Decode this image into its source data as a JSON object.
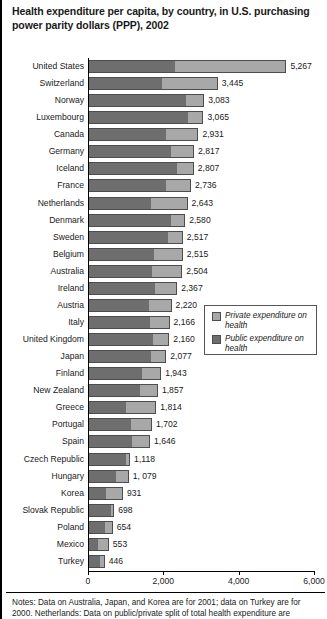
{
  "chart_data": {
    "type": "bar",
    "orientation": "horizontal",
    "stacked": true,
    "title": "Health expenditure per capita, by country, in U.S. purchasing power parity dollars (PPP), 2002",
    "xlabel": "",
    "ylabel": "",
    "xlim": [
      0,
      6000
    ],
    "xticks": [
      0,
      2000,
      4000,
      6000
    ],
    "xtick_labels": [
      "0",
      "2,000",
      "4,000",
      "6,000"
    ],
    "grid": false,
    "legend_position": "middle-right",
    "legend": [
      {
        "name": "Private expenditure on health",
        "color": "#a8a8a8"
      },
      {
        "name": "Public expenditure on health",
        "color": "#6e6e6e"
      }
    ],
    "categories": [
      "United States",
      "Switzerland",
      "Norway",
      "Luxembourg",
      "Canada",
      "Germany",
      "Iceland",
      "France",
      "Netherlands",
      "Denmark",
      "Sweden",
      "Belgium",
      "Australia",
      "Ireland",
      "Austria",
      "Italy",
      "United Kingdom",
      "Japan",
      "Finland",
      "New Zealand",
      "Greece",
      "Portugal",
      "Spain",
      "Czech Republic",
      "Hungary",
      "Korea",
      "Slovak Republic",
      "Poland",
      "Mexico",
      "Turkey"
    ],
    "values": [
      5267,
      3445,
      3083,
      3065,
      2931,
      2817,
      2807,
      2736,
      2643,
      2580,
      2517,
      2515,
      2504,
      2367,
      2220,
      2166,
      2160,
      2077,
      1943,
      1857,
      1814,
      1702,
      1646,
      1118,
      1079,
      931,
      698,
      654,
      553,
      446
    ],
    "value_labels": [
      "5,267",
      "3,445",
      "3,083",
      "3,065",
      "2,931",
      "2,817",
      "2,807",
      "2,736",
      "2,643",
      "2,580",
      "2,517",
      "2,515",
      "2,504",
      "2,367",
      "2,220",
      "2,166",
      "2,160",
      "2,077",
      "1,943",
      "1,857",
      "1,814",
      "1,702",
      "1,646",
      "1,118",
      "1, 079",
      "931",
      "698",
      "654",
      "553",
      "446"
    ],
    "series": [
      {
        "name": "Public expenditure on health",
        "color": "#6e6e6e",
        "values": [
          2320,
          1965,
          2620,
          2665,
          2070,
          2220,
          2395,
          2080,
          1690,
          2230,
          2140,
          1760,
          1710,
          1800,
          1640,
          1660,
          1740,
          1680,
          1450,
          1400,
          1010,
          1155,
          1185,
          1020,
          765,
          480,
          620,
          470,
          250,
          320
        ]
      },
      {
        "name": "Private expenditure on health",
        "color": "#a8a8a8",
        "values": [
          2947,
          1480,
          463,
          400,
          861,
          597,
          412,
          656,
          953,
          350,
          377,
          755,
          794,
          567,
          580,
          506,
          420,
          397,
          493,
          457,
          804,
          547,
          461,
          98,
          314,
          451,
          78,
          184,
          303,
          126
        ]
      }
    ],
    "notes": [
      "Notes: Data on Australia, Japan, and Korea are for 2001; data on Turkey are for",
      "2000. Netherlands: Data on public/private split of total health expenditure are"
    ]
  }
}
